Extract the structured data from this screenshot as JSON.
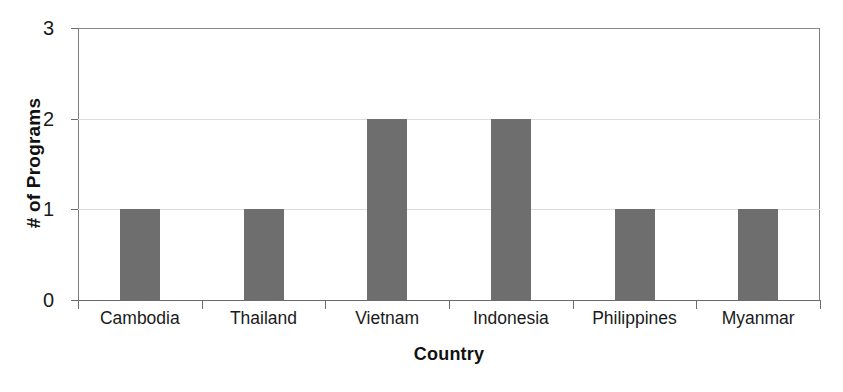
{
  "chart_data": {
    "type": "bar",
    "title": "",
    "xlabel": "Country",
    "ylabel": "# of Programs",
    "categories": [
      "Cambodia",
      "Thailand",
      "Vietnam",
      "Indonesia",
      "Philippines",
      "Myanmar"
    ],
    "values": [
      1,
      1,
      2,
      2,
      1,
      1
    ],
    "ylim": [
      0,
      3
    ],
    "ytick_labels": [
      "0",
      "1",
      "2",
      "3"
    ],
    "ytick_values": [
      0,
      1,
      2,
      3
    ],
    "grid": true,
    "legend": false,
    "legend_position": "none",
    "bar_color": "#6e6e6e",
    "gridline_color": "#dcdcdc",
    "axis_color": "#6b6b6b",
    "background_color": "#ffffff"
  }
}
